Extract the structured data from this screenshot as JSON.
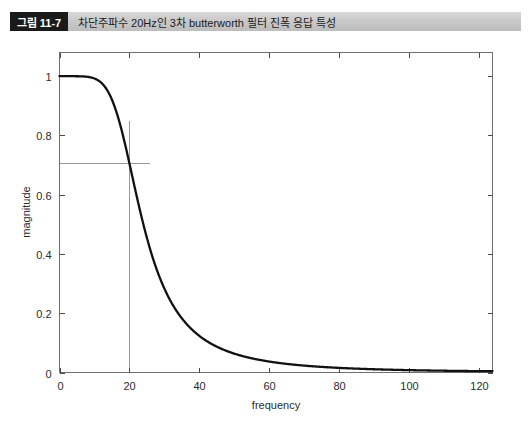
{
  "caption": {
    "figure_number": "그림 11-7",
    "text": "차단주파수 20Hz인 3차 butterworth 필터 진폭 응답 특성"
  },
  "colors": {
    "badge_background": "#1a1a1a",
    "badge_text": "#ffffff",
    "caption_bar": "#c9c9c9",
    "curve": "#111111",
    "axis": "#6f6f6f",
    "guide_line": "#9a9a9a"
  },
  "chart_data": {
    "type": "line",
    "title": "",
    "xlabel": "frequency",
    "ylabel": "magnitude",
    "xlim": [
      0,
      124
    ],
    "ylim": [
      0,
      1.08
    ],
    "xticks": [
      0,
      20,
      40,
      60,
      80,
      100,
      120
    ],
    "xtick_labels": [
      "0",
      "20",
      "40",
      "60",
      "80",
      "100",
      "120"
    ],
    "yticks": [
      0,
      0.2,
      0.4,
      0.6,
      0.8,
      1
    ],
    "ytick_labels": [
      "0",
      "0.2",
      "0.4",
      "0.6",
      "0.8",
      "1"
    ],
    "grid": false,
    "legend": null,
    "annotations": [
      {
        "name": "cutoff-vertical-line",
        "type": "vline",
        "x": 20,
        "y_from": 0,
        "y_to": 0.85,
        "color": "#9a9a9a"
      },
      {
        "name": "half-power-horizontal-line",
        "type": "hline",
        "y": 0.707,
        "x_from": 0,
        "x_to": 26,
        "color": "#9a9a9a"
      }
    ],
    "series": [
      {
        "name": "3rd-order Butterworth magnitude",
        "formula": "1/sqrt(1+(f/20)^6)",
        "cutoff_hz": 20,
        "order": 3,
        "x": [
          0,
          2,
          4,
          6,
          8,
          10,
          12,
          14,
          16,
          18,
          20,
          22,
          24,
          26,
          28,
          30,
          32,
          34,
          36,
          38,
          40,
          44,
          48,
          52,
          56,
          60,
          64,
          68,
          72,
          76,
          80,
          88,
          96,
          104,
          112,
          120,
          124
        ],
        "values": [
          1.0,
          1.0,
          1.0,
          1.0,
          0.999,
          0.999,
          0.997,
          0.993,
          0.984,
          0.967,
          0.707,
          0.883,
          0.819,
          0.744,
          0.666,
          0.591,
          0.522,
          0.46,
          0.406,
          0.359,
          0.319,
          0.254,
          0.205,
          0.168,
          0.14,
          0.117,
          0.1,
          0.086,
          0.074,
          0.065,
          0.057,
          0.043,
          0.033,
          0.027,
          0.022,
          0.018,
          0.016
        ]
      }
    ]
  }
}
